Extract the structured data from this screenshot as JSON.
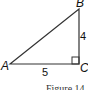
{
  "diagram": {
    "type": "right-triangle",
    "vertices": [
      {
        "label": "A",
        "x": 10,
        "y": 64
      },
      {
        "label": "B",
        "x": 79,
        "y": 9
      },
      {
        "label": "C",
        "x": 79,
        "y": 64
      }
    ],
    "right_angle_at": "C",
    "side_labels": {
      "AC": "5",
      "BC": "4"
    },
    "caption": "Figure 14",
    "colors": {
      "stroke": "#333333",
      "text": "#111111"
    }
  }
}
